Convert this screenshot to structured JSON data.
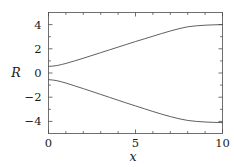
{
  "chart_data": {
    "type": "line",
    "title": "",
    "subtitle": "",
    "xlabel": "x",
    "ylabel": "R",
    "xlim": [
      0,
      10
    ],
    "ylim": [
      -5,
      5
    ],
    "xticks": [
      0,
      5,
      10
    ],
    "xtick_labels": [
      "0",
      "5",
      "10"
    ],
    "xminor_ticks": [
      1,
      2,
      3,
      4,
      6,
      7,
      8,
      9
    ],
    "yticks": [
      -4,
      -2,
      0,
      2,
      4
    ],
    "ytick_labels": [
      "-4",
      "-2",
      "0",
      "2",
      "4"
    ],
    "yminor_ticks": [
      -5,
      -3,
      -1,
      1,
      3,
      5
    ],
    "grid": false,
    "legend": false,
    "legend_position": "none",
    "frame": true,
    "tick_direction": "in",
    "line_color": "#4d4d4d",
    "line_width": 0.9,
    "background_color": "#ffffff",
    "axis_color": "#4d4d4d",
    "text_color": "#1a1a1a",
    "x": [
      0,
      0.25,
      0.5,
      0.75,
      1,
      1.5,
      2,
      2.5,
      3,
      3.5,
      4,
      4.5,
      5,
      5.5,
      6,
      6.5,
      7,
      7.5,
      8,
      8.5,
      9,
      9.5,
      10
    ],
    "series": [
      {
        "name": "upper-branch",
        "values": [
          0.55,
          0.57,
          0.62,
          0.7,
          0.79,
          1.0,
          1.22,
          1.45,
          1.68,
          1.91,
          2.14,
          2.37,
          2.6,
          2.82,
          3.04,
          3.26,
          3.47,
          3.66,
          3.82,
          3.9,
          3.95,
          3.98,
          4.0
        ]
      },
      {
        "name": "lower-branch",
        "values": [
          -0.55,
          -0.58,
          -0.64,
          -0.73,
          -0.83,
          -1.06,
          -1.29,
          -1.53,
          -1.77,
          -2.01,
          -2.25,
          -2.49,
          -2.72,
          -2.95,
          -3.18,
          -3.4,
          -3.6,
          -3.78,
          -3.92,
          -4.0,
          -4.05,
          -4.08,
          -4.1
        ]
      }
    ]
  }
}
